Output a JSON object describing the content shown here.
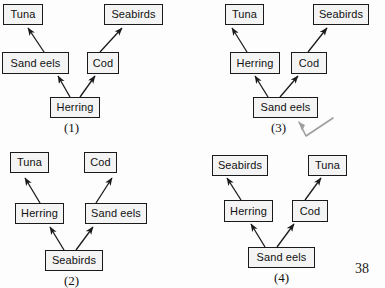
{
  "page": {
    "page_number": "38",
    "background_color": "#fdfdfd",
    "ink_color": "#1a1a1a",
    "box_fill_color": "#f4f4f4",
    "annotation_color": "#9a9a9a"
  },
  "diagrams": [
    {
      "id": "diagram-1",
      "caption": "(1)",
      "nodes": [
        {
          "name": "tuna",
          "label": "Tuna"
        },
        {
          "name": "seabirds",
          "label": "Seabirds"
        },
        {
          "name": "sand-eels",
          "label": "Sand eels"
        },
        {
          "name": "cod",
          "label": "Cod"
        },
        {
          "name": "herring",
          "label": "Herring"
        }
      ],
      "edges": [
        {
          "from": "sand-eels",
          "to": "tuna"
        },
        {
          "from": "cod",
          "to": "seabirds"
        },
        {
          "from": "herring",
          "to": "sand-eels"
        },
        {
          "from": "herring",
          "to": "cod"
        }
      ]
    },
    {
      "id": "diagram-3",
      "caption": "(3)",
      "nodes": [
        {
          "name": "tuna",
          "label": "Tuna"
        },
        {
          "name": "seabirds",
          "label": "Seabirds"
        },
        {
          "name": "herring",
          "label": "Herring"
        },
        {
          "name": "cod",
          "label": "Cod"
        },
        {
          "name": "sand-eels",
          "label": "Sand eels"
        }
      ],
      "edges": [
        {
          "from": "herring",
          "to": "tuna"
        },
        {
          "from": "cod",
          "to": "seabirds"
        },
        {
          "from": "sand-eels",
          "to": "herring"
        },
        {
          "from": "sand-eels",
          "to": "cod"
        }
      ]
    },
    {
      "id": "diagram-2",
      "caption": "(2)",
      "nodes": [
        {
          "name": "tuna",
          "label": "Tuna"
        },
        {
          "name": "cod",
          "label": "Cod"
        },
        {
          "name": "herring",
          "label": "Herring"
        },
        {
          "name": "sand-eels",
          "label": "Sand eels"
        },
        {
          "name": "seabirds",
          "label": "Seabirds"
        }
      ],
      "edges": [
        {
          "from": "herring",
          "to": "tuna"
        },
        {
          "from": "sand-eels",
          "to": "cod"
        },
        {
          "from": "seabirds",
          "to": "herring"
        },
        {
          "from": "seabirds",
          "to": "sand-eels"
        }
      ]
    },
    {
      "id": "diagram-4",
      "caption": "(4)",
      "nodes": [
        {
          "name": "seabirds",
          "label": "Seabirds"
        },
        {
          "name": "tuna",
          "label": "Tuna"
        },
        {
          "name": "herring",
          "label": "Herring"
        },
        {
          "name": "cod",
          "label": "Cod"
        },
        {
          "name": "sand-eels",
          "label": "Sand eels"
        }
      ],
      "edges": [
        {
          "from": "herring",
          "to": "seabirds"
        },
        {
          "from": "cod",
          "to": "tuna"
        },
        {
          "from": "sand-eels",
          "to": "herring"
        },
        {
          "from": "sand-eels",
          "to": "cod"
        }
      ]
    }
  ],
  "annotation": {
    "name": "handwritten-check-mark",
    "visible": true
  }
}
